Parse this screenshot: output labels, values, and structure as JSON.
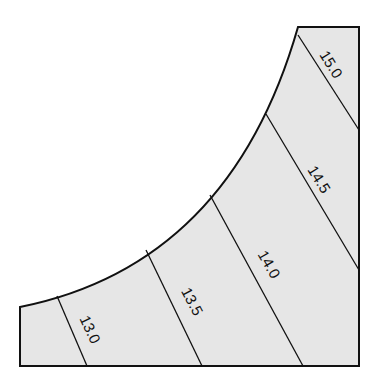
{
  "diagram": {
    "type": "contour-region",
    "fill_color": "#e6e6e6",
    "stroke_color": "#111111",
    "background": "#ffffff",
    "contours": [
      {
        "value": "15.0",
        "label_x": 330,
        "label_y": 65,
        "angle": 58
      },
      {
        "value": "14.5",
        "label_x": 318,
        "label_y": 180,
        "angle": 58
      },
      {
        "value": "14.0",
        "label_x": 268,
        "label_y": 265,
        "angle": 60
      },
      {
        "value": "13.5",
        "label_x": 190,
        "label_y": 302,
        "angle": 62
      },
      {
        "value": "13.0",
        "label_x": 88,
        "label_y": 330,
        "angle": 65
      }
    ]
  }
}
